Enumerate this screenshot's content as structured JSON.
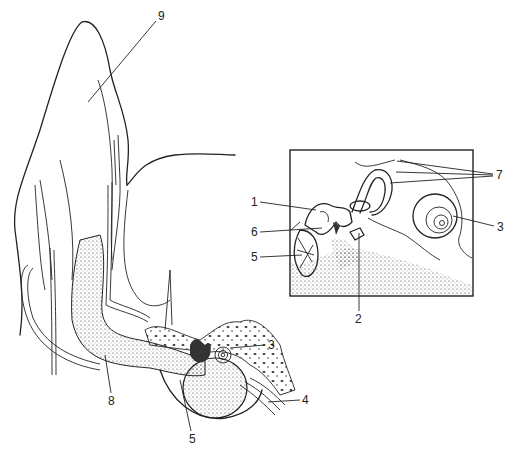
{
  "diagram": {
    "inset": {
      "visible": true
    },
    "labels": [
      {
        "id": "9",
        "text": "9",
        "x": 158,
        "y": 16
      },
      {
        "id": "7",
        "text": "7",
        "x": 496,
        "y": 168
      },
      {
        "id": "1",
        "text": "1",
        "x": 251,
        "y": 198
      },
      {
        "id": "3a",
        "text": "3",
        "x": 497,
        "y": 222
      },
      {
        "id": "6",
        "text": "6",
        "x": 251,
        "y": 228
      },
      {
        "id": "5a",
        "text": "5",
        "x": 251,
        "y": 253
      },
      {
        "id": "2",
        "text": "2",
        "x": 355,
        "y": 315
      },
      {
        "id": "3b",
        "text": "3",
        "x": 268,
        "y": 341
      },
      {
        "id": "4",
        "text": "4",
        "x": 302,
        "y": 396
      },
      {
        "id": "8",
        "text": "8",
        "x": 108,
        "y": 397
      },
      {
        "id": "5b",
        "text": "5",
        "x": 189,
        "y": 435
      }
    ]
  }
}
